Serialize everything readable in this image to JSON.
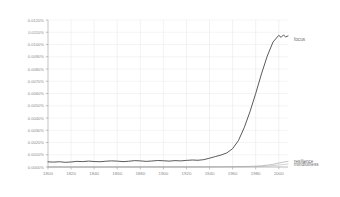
{
  "chart_data": {
    "type": "line",
    "title": "",
    "xlabel": "",
    "ylabel": "",
    "xlim": [
      1800,
      2008
    ],
    "ylim": [
      0.0,
      0.012
    ],
    "grid": true,
    "legend_position": "right-inline-labels",
    "x_tick_labels": [
      "1800",
      "1820",
      "1840",
      "1860",
      "1880",
      "1900",
      "1920",
      "1940",
      "1960",
      "1980",
      "2000"
    ],
    "x_ticks": [
      1800,
      1820,
      1840,
      1860,
      1880,
      1900,
      1920,
      1940,
      1960,
      1980,
      2000
    ],
    "y_tick_labels": [
      "0.0000%",
      "0.0010%",
      "0.0020%",
      "0.0030%",
      "0.0040%",
      "0.0050%",
      "0.0060%",
      "0.0070%",
      "0.0080%",
      "0.0090%",
      "0.0100%",
      "0.0110%",
      "0.0120%"
    ],
    "y_ticks": [
      0.0,
      0.001,
      0.002,
      0.003,
      0.004,
      0.005,
      0.006,
      0.007,
      0.008,
      0.009,
      0.01,
      0.011,
      0.012
    ],
    "y_unit": "%",
    "series": [
      {
        "name": "focus",
        "color": "#3c3c3c",
        "label_x": 2008,
        "label_y": 0.0104,
        "x": [
          1800,
          1805,
          1810,
          1815,
          1820,
          1825,
          1830,
          1835,
          1840,
          1845,
          1850,
          1855,
          1860,
          1865,
          1870,
          1875,
          1880,
          1885,
          1890,
          1895,
          1900,
          1905,
          1910,
          1915,
          1920,
          1925,
          1930,
          1935,
          1940,
          1945,
          1950,
          1955,
          1960,
          1965,
          1970,
          1975,
          1980,
          1985,
          1990,
          1995,
          2000,
          2002,
          2004,
          2006,
          2008
        ],
        "values": [
          0.00042,
          0.0004,
          0.00043,
          0.00038,
          0.00041,
          0.00046,
          0.00044,
          0.00048,
          0.00045,
          0.00043,
          0.00047,
          0.0005,
          0.00048,
          0.00044,
          0.00047,
          0.00052,
          0.0005,
          0.00046,
          0.00049,
          0.00053,
          0.00051,
          0.00048,
          0.00052,
          0.0005,
          0.00054,
          0.00057,
          0.00055,
          0.0006,
          0.00072,
          0.00085,
          0.00098,
          0.00115,
          0.0015,
          0.00215,
          0.0032,
          0.0045,
          0.006,
          0.0076,
          0.00905,
          0.0102,
          0.01075,
          0.01058,
          0.01078,
          0.01062,
          0.0107
        ]
      },
      {
        "name": "resilience",
        "color": "#9b9b9b",
        "label_x": 2008,
        "label_y": 0.00048,
        "x": [
          1800,
          1850,
          1900,
          1930,
          1950,
          1960,
          1970,
          1975,
          1980,
          1985,
          1990,
          1995,
          2000,
          2004,
          2008
        ],
        "values": [
          0.0,
          0.0,
          1e-05,
          1e-05,
          2e-05,
          3e-05,
          4e-05,
          5e-05,
          7e-05,
          0.0001,
          0.00015,
          0.00022,
          0.00032,
          0.0004,
          0.00046
        ]
      },
      {
        "name": "mindfulness",
        "color": "#b4b4b4",
        "label_x": 2008,
        "label_y": 0.00018,
        "x": [
          1800,
          1850,
          1900,
          1930,
          1950,
          1960,
          1970,
          1975,
          1980,
          1985,
          1990,
          1995,
          2000,
          2004,
          2008
        ],
        "values": [
          0.0,
          0.0,
          0.0,
          0.0,
          0.0,
          1e-05,
          1e-05,
          2e-05,
          3e-05,
          4e-05,
          7e-05,
          0.00011,
          0.00016,
          0.0002,
          0.00024
        ]
      }
    ]
  }
}
